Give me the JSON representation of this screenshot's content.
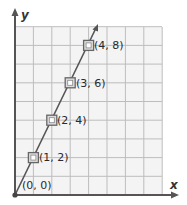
{
  "chart_data": {
    "type": "line",
    "title": "",
    "xlabel": "x",
    "ylabel": "y",
    "xlim": [
      0,
      8
    ],
    "ylim": [
      0,
      9
    ],
    "grid": true,
    "series": [
      {
        "name": "y = 2x",
        "x": [
          0,
          1,
          2,
          3,
          4
        ],
        "y": [
          0,
          2,
          4,
          6,
          8
        ],
        "point_labels": [
          "(0, 0)",
          "(1, 2)",
          "(2, 4)",
          "(3, 6)",
          "(4, 8)"
        ]
      }
    ],
    "colors": {
      "line": "#555555",
      "grid": "#bdbdbd",
      "grid_fill": "#f3f3f3",
      "axis": "#555555",
      "marker": "#666666"
    }
  },
  "labels": {
    "x_axis": "x",
    "y_axis": "y",
    "p0": "(0, 0)",
    "p1": "(1, 2)",
    "p2": "(2, 4)",
    "p3": "(3, 6)",
    "p4": "(4, 8)"
  }
}
